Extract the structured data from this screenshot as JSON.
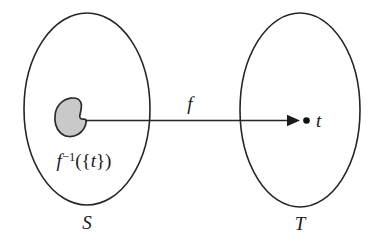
{
  "figure": {
    "kind": "set-mapping-diagram",
    "background_color": "#ffffff",
    "stroke_color": "#262626",
    "blob_fill_color": "#c9c9c9"
  },
  "domain_set": {
    "label": "S",
    "shape": "ellipse"
  },
  "codomain_set": {
    "label": "T",
    "shape": "ellipse"
  },
  "function": {
    "label": "f",
    "arrow": "right-arrow"
  },
  "preimage": {
    "label_f": "f",
    "label_exponent": "−1",
    "label_braces_open": "({",
    "label_t": "t",
    "label_braces_close": "})",
    "full_label": "f−1({t})"
  },
  "element": {
    "label": "t",
    "marker": "filled-dot"
  }
}
